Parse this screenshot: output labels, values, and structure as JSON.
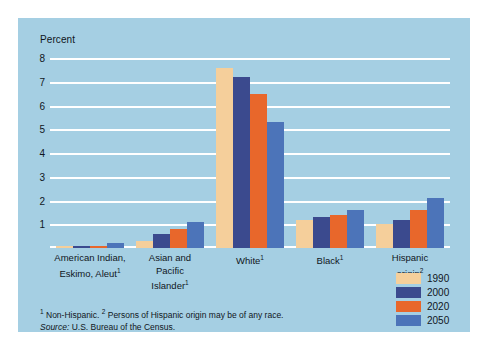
{
  "figure": {
    "background_color": "#a5cfe3",
    "axis_title": "Percent"
  },
  "footnotes": {
    "note_marker_1": "1",
    "note_text_1": " Non-Hispanic. ",
    "note_marker_2": "2",
    "note_text_2": " Persons of Hispanic origin may be of any race.",
    "source_label": "Source:",
    "source_text": " U.S. Bureau of the Census."
  },
  "legend": {
    "position": "bottom-right",
    "entries": [
      {
        "label": "1990",
        "color": "#f5cf9b"
      },
      {
        "label": "2000",
        "color": "#3b4a8e"
      },
      {
        "label": "2020",
        "color": "#e8672b"
      },
      {
        "label": "2050",
        "color": "#4c74b9"
      }
    ]
  },
  "chart_data": {
    "type": "bar",
    "title": "",
    "xlabel": "",
    "ylabel": "Percent",
    "ylim": [
      0,
      8
    ],
    "yticks": [
      1,
      2,
      3,
      4,
      5,
      6,
      7,
      8
    ],
    "ytick_labels": [
      "1",
      "2",
      "3",
      "4",
      "5",
      "6",
      "7",
      "8"
    ],
    "grid": true,
    "grid_color": "#ffffff",
    "categories": [
      "American Indian, Eskimo, Aleut",
      "Asian and Pacific Islander",
      "White",
      "Black",
      "Hispanic origin"
    ],
    "category_lines": [
      [
        "American Indian,",
        "Eskimo, Aleut"
      ],
      [
        "Asian and",
        "Pacific",
        "Islander"
      ],
      [
        "White"
      ],
      [
        "Black"
      ],
      [
        "Hispanic",
        "origin"
      ]
    ],
    "category_footnote_markers": [
      "1",
      "1",
      "1",
      "1",
      "2"
    ],
    "series": [
      {
        "name": "1990",
        "color": "#f5cf9b",
        "values": [
          0.1,
          0.3,
          7.6,
          1.2,
          1.0
        ]
      },
      {
        "name": "2000",
        "color": "#3b4a8e",
        "values": [
          0.1,
          0.6,
          7.2,
          1.3,
          1.2
        ]
      },
      {
        "name": "2020",
        "color": "#e8672b",
        "values": [
          0.1,
          0.8,
          6.5,
          1.4,
          1.6
        ]
      },
      {
        "name": "2050",
        "color": "#4c74b9",
        "values": [
          0.2,
          1.1,
          5.3,
          1.6,
          2.1
        ]
      }
    ]
  }
}
